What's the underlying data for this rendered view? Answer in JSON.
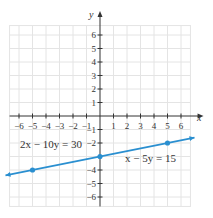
{
  "chart_data": {
    "type": "line",
    "title": "",
    "xlabel": "x",
    "ylabel": "y",
    "xlim": [
      -7,
      7
    ],
    "ylim": [
      -7,
      7
    ],
    "grid": true,
    "x_ticks": [
      -6,
      -5,
      -4,
      -3,
      -2,
      -1,
      1,
      2,
      3,
      4,
      5,
      6
    ],
    "y_ticks": [
      -6,
      -5,
      -4,
      -2,
      -1,
      1,
      2,
      3,
      4,
      5,
      6
    ],
    "x_tick_labels": [
      "−6",
      "−5",
      "−4",
      "−3",
      "−2",
      "−1",
      "1",
      "2",
      "3",
      "4",
      "5",
      "6"
    ],
    "y_tick_labels": [
      "6",
      "5",
      "4",
      "3",
      "2",
      "1",
      "−1",
      "−2",
      "−4",
      "−5",
      "−6"
    ],
    "series": [
      {
        "name": "x − 5y = 15",
        "equation": "y = x/5 - 3",
        "color": "#2a8fd0",
        "marked_points": [
          [
            -5,
            -4
          ],
          [
            0,
            -3
          ],
          [
            5,
            -2
          ]
        ],
        "line_extent": [
          [
            -7,
            -4.4
          ],
          [
            7,
            -1.6
          ]
        ]
      }
    ],
    "annotations": [
      {
        "text": "2x − 10y = 30",
        "x": -6.5,
        "y": -2.7
      },
      {
        "text": "x − 5y = 15",
        "x": 1.5,
        "y": -3.0
      }
    ]
  },
  "labels": {
    "x_axis": "x",
    "y_axis": "y",
    "eq_left": "2x − 10y = 30",
    "eq_right": "x − 5y = 15"
  },
  "colors": {
    "grid": "#e4e4e4",
    "axis": "#333333",
    "line": "#2a8fd0"
  }
}
